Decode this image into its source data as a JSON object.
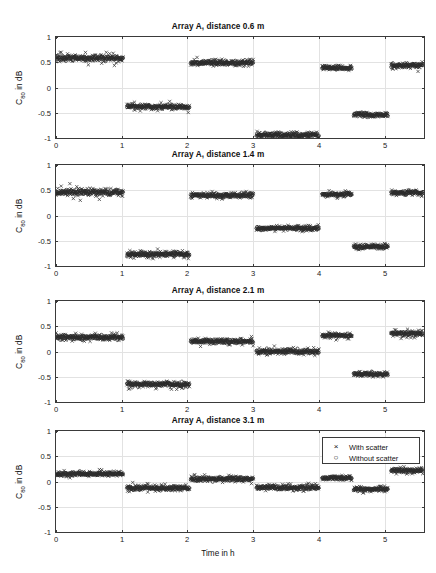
{
  "figure": {
    "xlabel": "Time in h",
    "ylabel_main": "C",
    "ylabel_sub": "80",
    "ylabel_tail": " in dB",
    "ylabel_full": "C80 in dB",
    "background": "#ffffff",
    "marker_color": "#2b2b2b",
    "axis_color": "#3a3a3a",
    "grid_color": "#e2e2e2"
  },
  "legend": {
    "position": "top-right of bottom panel",
    "entries": [
      {
        "marker": "×",
        "marker_name": "cross-marker",
        "label": "With scatter"
      },
      {
        "marker": "○",
        "marker_name": "circle-marker",
        "label": "Without scatter"
      }
    ]
  },
  "chart_data": [
    {
      "type": "scatter",
      "title": "Array A, distance 0.6 m",
      "xlabel": "Time in h",
      "ylabel": "C80 in dB",
      "xlim": [
        0,
        5.6
      ],
      "ylim": [
        -1,
        1
      ],
      "xticks": [
        0,
        1,
        2,
        3,
        4,
        5
      ],
      "yticks": [
        -1,
        -0.5,
        0,
        0.5,
        1
      ],
      "grid": true,
      "series": [
        {
          "name": "With scatter",
          "marker": "x"
        },
        {
          "name": "Without scatter",
          "marker": "o"
        }
      ],
      "segments": [
        {
          "x_start": 0.0,
          "x_end": 1.02,
          "level": 0.58,
          "noise": 0.045
        },
        {
          "x_start": 1.08,
          "x_end": 2.03,
          "level": -0.38,
          "noise": 0.035
        },
        {
          "x_start": 2.05,
          "x_end": 3.0,
          "level": 0.49,
          "noise": 0.035
        },
        {
          "x_start": 3.05,
          "x_end": 4.0,
          "level": -0.94,
          "noise": 0.035
        },
        {
          "x_start": 4.05,
          "x_end": 4.5,
          "level": 0.39,
          "noise": 0.03
        },
        {
          "x_start": 4.53,
          "x_end": 5.05,
          "level": -0.54,
          "noise": 0.03
        },
        {
          "x_start": 5.1,
          "x_end": 5.58,
          "level": 0.43,
          "noise": 0.035
        }
      ]
    },
    {
      "type": "scatter",
      "title": "Array A, distance 1.4 m",
      "xlabel": "Time in h",
      "ylabel": "C80 in dB",
      "xlim": [
        0,
        5.6
      ],
      "ylim": [
        -1,
        1
      ],
      "xticks": [
        0,
        1,
        2,
        3,
        4,
        5
      ],
      "yticks": [
        -1,
        -0.5,
        0,
        0.5,
        1
      ],
      "grid": true,
      "series": [
        {
          "name": "With scatter",
          "marker": "x"
        },
        {
          "name": "Without scatter",
          "marker": "o"
        }
      ],
      "segments": [
        {
          "x_start": 0.0,
          "x_end": 1.02,
          "level": 0.46,
          "noise": 0.045
        },
        {
          "x_start": 1.08,
          "x_end": 2.03,
          "level": -0.77,
          "noise": 0.035
        },
        {
          "x_start": 2.05,
          "x_end": 3.0,
          "level": 0.4,
          "noise": 0.035
        },
        {
          "x_start": 3.05,
          "x_end": 4.0,
          "level": -0.25,
          "noise": 0.03
        },
        {
          "x_start": 4.05,
          "x_end": 4.5,
          "level": 0.42,
          "noise": 0.03
        },
        {
          "x_start": 4.53,
          "x_end": 5.05,
          "level": -0.62,
          "noise": 0.03
        },
        {
          "x_start": 5.1,
          "x_end": 5.58,
          "level": 0.45,
          "noise": 0.035
        }
      ]
    },
    {
      "type": "scatter",
      "title": "Array A, distance 2.1 m",
      "xlabel": "Time in h",
      "ylabel": "C80 in dB",
      "xlim": [
        0,
        5.6
      ],
      "ylim": [
        -1,
        1
      ],
      "xticks": [
        0,
        1,
        2,
        3,
        4,
        5
      ],
      "yticks": [
        -1,
        -0.5,
        0,
        0.5,
        1
      ],
      "grid": true,
      "series": [
        {
          "name": "With scatter",
          "marker": "x"
        },
        {
          "name": "Without scatter",
          "marker": "o"
        }
      ],
      "segments": [
        {
          "x_start": 0.0,
          "x_end": 1.02,
          "level": 0.28,
          "noise": 0.04
        },
        {
          "x_start": 1.08,
          "x_end": 2.03,
          "level": -0.65,
          "noise": 0.035
        },
        {
          "x_start": 2.05,
          "x_end": 3.0,
          "level": 0.2,
          "noise": 0.035
        },
        {
          "x_start": 3.05,
          "x_end": 4.0,
          "level": 0.0,
          "noise": 0.035
        },
        {
          "x_start": 4.05,
          "x_end": 4.5,
          "level": 0.32,
          "noise": 0.03
        },
        {
          "x_start": 4.53,
          "x_end": 5.05,
          "level": -0.45,
          "noise": 0.03
        },
        {
          "x_start": 5.1,
          "x_end": 5.58,
          "level": 0.36,
          "noise": 0.035
        }
      ]
    },
    {
      "type": "scatter",
      "title": "Array A, distance 3.1 m",
      "xlabel": "Time in h",
      "ylabel": "C80 in dB",
      "xlim": [
        0,
        5.6
      ],
      "ylim": [
        -1,
        1
      ],
      "xticks": [
        0,
        1,
        2,
        3,
        4,
        5
      ],
      "yticks": [
        -1,
        -0.5,
        0,
        0.5,
        1
      ],
      "grid": true,
      "series": [
        {
          "name": "With scatter",
          "marker": "x"
        },
        {
          "name": "Without scatter",
          "marker": "o"
        }
      ],
      "segments": [
        {
          "x_start": 0.0,
          "x_end": 1.02,
          "level": 0.15,
          "noise": 0.03
        },
        {
          "x_start": 1.08,
          "x_end": 2.03,
          "level": -0.13,
          "noise": 0.035
        },
        {
          "x_start": 2.05,
          "x_end": 3.0,
          "level": 0.05,
          "noise": 0.035
        },
        {
          "x_start": 3.05,
          "x_end": 4.0,
          "level": -0.12,
          "noise": 0.035
        },
        {
          "x_start": 4.05,
          "x_end": 4.5,
          "level": 0.07,
          "noise": 0.03
        },
        {
          "x_start": 4.53,
          "x_end": 5.05,
          "level": -0.15,
          "noise": 0.03
        },
        {
          "x_start": 5.1,
          "x_end": 5.58,
          "level": 0.22,
          "noise": 0.03
        }
      ]
    }
  ],
  "panel_geometry": [
    {
      "title_y": 22,
      "box_x": 55,
      "box_y": 36,
      "box_w": 370,
      "box_h": 103
    },
    {
      "title_y": 150,
      "box_x": 55,
      "box_y": 164,
      "box_w": 370,
      "box_h": 103
    },
    {
      "title_y": 286,
      "box_x": 55,
      "box_y": 300,
      "box_w": 370,
      "box_h": 103
    },
    {
      "title_y": 416,
      "box_x": 55,
      "box_y": 430,
      "box_w": 370,
      "box_h": 103
    }
  ],
  "xlabel_y": 549,
  "legend_geometry": {
    "x": 322,
    "y": 437,
    "w": 98,
    "h": 27
  }
}
